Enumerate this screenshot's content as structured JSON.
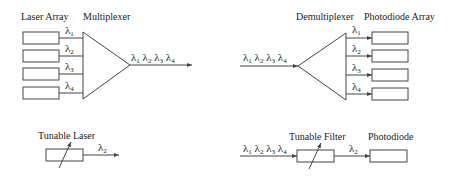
{
  "wdm_mux": {
    "source_label": "Laser Array",
    "device_label": "Multiplexer",
    "inputs": [
      "λ1",
      "λ2",
      "λ3",
      "λ4"
    ],
    "output": "λ1 λ2 λ3 λ4"
  },
  "wdm_demux": {
    "device_label": "Demultiplexer",
    "detector_label": "Photodiode Array",
    "input": "λ1 λ2 λ3 λ4",
    "outputs": [
      "λ1",
      "λ2",
      "λ3",
      "λ4"
    ]
  },
  "tunable_source": {
    "label": "Tunable Laser",
    "output": "λ2"
  },
  "tunable_receiver": {
    "input": "λ1 λ2 λ3 λ4",
    "filter_label": "Tunable Filter",
    "filter_output": "λ2",
    "detector_label": "Photodiode"
  },
  "symbols": {
    "lambda": "λ",
    "subs": [
      "1",
      "2",
      "3",
      "4"
    ]
  },
  "colors": {
    "stroke": "#444444",
    "text": "#222222"
  }
}
